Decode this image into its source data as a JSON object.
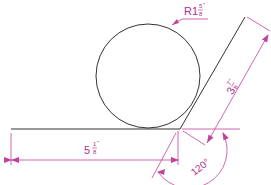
{
  "drawing": {
    "colors": {
      "geometry": "#333333",
      "dimension": "#c2409a"
    },
    "radius_label": {
      "prefix": "R1",
      "numerator": "5",
      "denominator": "8",
      "unit": "\""
    },
    "horizontal_dim": {
      "whole": "5",
      "numerator": "1",
      "denominator": "8",
      "unit": "\""
    },
    "inclined_dim": {
      "whole": "3",
      "numerator": "7",
      "denominator": "8",
      "unit": "\""
    },
    "angle_dim": {
      "label": "120°"
    }
  }
}
